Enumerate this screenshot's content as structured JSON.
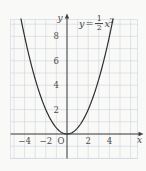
{
  "figure": {
    "equation_label": {
      "lhs": "y",
      "relation": "=",
      "numerator": "1",
      "denominator": "2",
      "term": "x",
      "exponent": "2"
    },
    "axis": {
      "x_label": "x",
      "y_label": "y",
      "origin_label": "O"
    }
  },
  "chart_data": {
    "type": "line",
    "equation": "y = (1/2)x²",
    "coefficient": 0.5,
    "x": [
      -4,
      -3,
      -2,
      -1,
      0,
      1,
      2,
      3,
      4
    ],
    "y": [
      8,
      4.5,
      2,
      0.5,
      0,
      0.5,
      2,
      4.5,
      8
    ],
    "xlabel": "x",
    "ylabel": "y",
    "xlim": [
      -5.3,
      6.6
    ],
    "ylim": [
      -2.2,
      9.4
    ],
    "grid": true,
    "x_tick_values": [
      -4,
      -2,
      2,
      4
    ],
    "x_tick_labels": [
      "−4",
      "−2",
      "2",
      "4"
    ],
    "y_tick_values": [
      2,
      4,
      6,
      8
    ],
    "y_tick_labels": [
      "2",
      "4",
      "6",
      "8"
    ],
    "colors": {
      "background": "#f9f9f7",
      "grid": "#ccd4de",
      "axis": "#3f3f3f",
      "curve": "#2e2e2e",
      "text": "#4a4a4a"
    }
  }
}
